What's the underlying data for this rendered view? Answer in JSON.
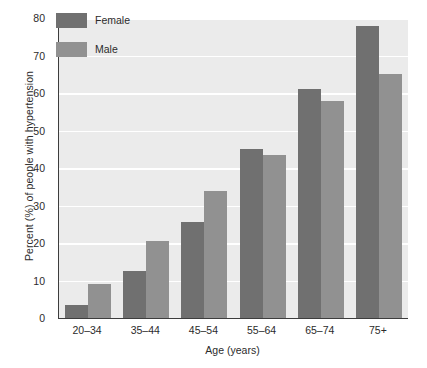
{
  "chart_data": {
    "type": "bar",
    "title": "",
    "subtitle": "",
    "xlabel": "Age (years)",
    "ylabel": "Percent (%) of people with hypertension",
    "categories": [
      "20–34",
      "35–44",
      "45–54",
      "55–64",
      "65–74",
      "75+"
    ],
    "series": [
      {
        "name": "Female",
        "color": "#707070",
        "values": [
          3.5,
          12.5,
          25.5,
          45,
          61,
          78
        ]
      },
      {
        "name": "Male",
        "color": "#919191",
        "values": [
          9,
          20.5,
          34,
          43.5,
          58,
          65
        ]
      }
    ],
    "ylim": [
      0,
      80
    ],
    "ytick_values": [
      0,
      10,
      20,
      30,
      40,
      50,
      60,
      70,
      80
    ],
    "ytick_labels": [
      "0",
      "10",
      "20",
      "30",
      "40",
      "50",
      "60",
      "70",
      "80"
    ],
    "grid": "horizontal",
    "gridline_color": "#ffffff",
    "plot_background": "#ebebeb",
    "figure_background": "#ffffff",
    "axis_color": "#3d3d3d",
    "legend_position": "top-left-inside",
    "legend_entries": [
      "Female",
      "Male"
    ]
  }
}
